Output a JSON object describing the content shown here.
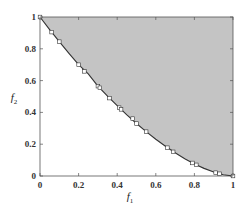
{
  "chart_data": {
    "type": "area",
    "title": "",
    "xlabel": "f1",
    "ylabel": "f2",
    "xlabel_main": "f",
    "xlabel_sub": "1",
    "ylabel_main": "f",
    "ylabel_sub": "2",
    "xlim": [
      0,
      1
    ],
    "ylim": [
      0,
      1
    ],
    "grid": false,
    "frame": true,
    "legend": null,
    "x_ticks": [
      0,
      0.2,
      0.4,
      0.6,
      0.8,
      1
    ],
    "y_ticks": [
      0,
      0.2,
      0.4,
      0.6,
      0.8,
      1
    ],
    "x_tick_labels": [
      "0",
      "0.2",
      "0.4",
      "0.6",
      "0.8",
      "1"
    ],
    "y_tick_labels": [
      "0",
      "0.2",
      "0.4",
      "0.6",
      "0.8",
      "1"
    ],
    "shaded_region": {
      "description": "dominated region above the Pareto front",
      "color": "#c4c4c4"
    },
    "series": [
      {
        "name": "Pareto front",
        "kind": "line",
        "color": "#333333",
        "x": [
          0,
          0.05,
          0.1,
          0.15,
          0.2,
          0.25,
          0.3,
          0.35,
          0.4,
          0.45,
          0.5,
          0.55,
          0.6,
          0.65,
          0.7,
          0.75,
          0.8,
          0.85,
          0.9,
          0.95,
          1
        ],
        "y": [
          1,
          0.921,
          0.845,
          0.771,
          0.7,
          0.642,
          0.565,
          0.502,
          0.442,
          0.384,
          0.33,
          0.279,
          0.231,
          0.187,
          0.146,
          0.109,
          0.076,
          0.048,
          0.025,
          0.008,
          0
        ]
      },
      {
        "name": "Solutions",
        "kind": "scatter",
        "marker": "open-square",
        "color": "#333333",
        "x": [
          0,
          0.06,
          0.1,
          0.2,
          0.23,
          0.3,
          0.31,
          0.36,
          0.41,
          0.42,
          0.48,
          0.5,
          0.55,
          0.66,
          0.69,
          0.79,
          0.81,
          0.91,
          0.93,
          1
        ],
        "y": [
          1,
          0.905,
          0.845,
          0.7,
          0.658,
          0.565,
          0.555,
          0.49,
          0.43,
          0.419,
          0.361,
          0.33,
          0.279,
          0.178,
          0.152,
          0.082,
          0.07,
          0.021,
          0.014,
          0
        ]
      }
    ]
  }
}
